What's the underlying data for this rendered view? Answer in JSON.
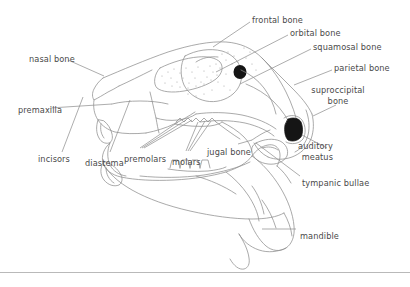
{
  "figure": {
    "line_color": "#8a8a8a",
    "label_color": "#4a4a4a",
    "fill_color": "#1a1a1a",
    "background": "#ffffff",
    "width": 410,
    "height": 287
  },
  "labels": [
    {
      "id": "frontal-bone",
      "text": "frontal bone",
      "x": 252,
      "y": 15,
      "align": "left"
    },
    {
      "id": "orbital-bone",
      "text": "orbital bone",
      "x": 290,
      "y": 28,
      "align": "left"
    },
    {
      "id": "squamosal-bone",
      "text": "squamosal bone",
      "x": 313,
      "y": 42,
      "align": "left"
    },
    {
      "id": "parietal-bone",
      "text": "parietal bone",
      "x": 334,
      "y": 63,
      "align": "left"
    },
    {
      "id": "suproccipital-bone",
      "text": "suproccipital bone",
      "x": 338,
      "y": 85,
      "align": "center"
    },
    {
      "id": "nasal-bone",
      "text": "nasal bone",
      "x": 29,
      "y": 54,
      "align": "left"
    },
    {
      "id": "premaxilla",
      "text": "premaxilla",
      "x": 18,
      "y": 105,
      "align": "left"
    },
    {
      "id": "incisors",
      "text": "incisors",
      "x": 38,
      "y": 154,
      "align": "left"
    },
    {
      "id": "diastema",
      "text": "diastema",
      "x": 85,
      "y": 158,
      "align": "left"
    },
    {
      "id": "premolars",
      "text": "premolars",
      "x": 124,
      "y": 154,
      "align": "left"
    },
    {
      "id": "molars",
      "text": "molars",
      "x": 172,
      "y": 157,
      "align": "left"
    },
    {
      "id": "jugal-bone",
      "text": "jugal bone",
      "x": 207,
      "y": 147,
      "align": "left"
    },
    {
      "id": "auditory-meatus",
      "text": "auditory meatus",
      "x": 333,
      "y": 141,
      "align": "right"
    },
    {
      "id": "tympanic-bullae",
      "text": "tympanic bullae",
      "x": 302,
      "y": 178,
      "align": "left"
    },
    {
      "id": "mandible",
      "text": "mandible",
      "x": 300,
      "y": 231,
      "align": "left"
    }
  ]
}
